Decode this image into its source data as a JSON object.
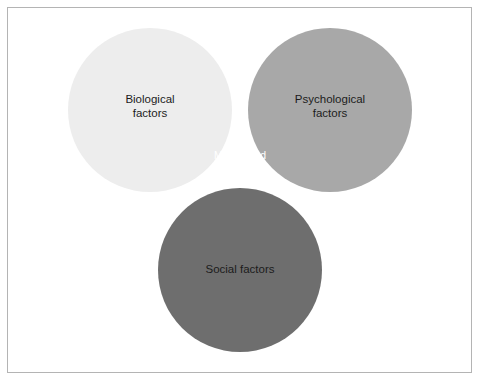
{
  "figure": {
    "type": "venn-diagram-3-set",
    "title": "",
    "background_color": "#ffffff",
    "frame_color": "#b4b4b4"
  },
  "chart_data": {
    "type": "diagram",
    "subtype": "venn",
    "set_count": 3,
    "title": "",
    "sets": [
      {
        "id": "biological",
        "label": "Biological\nfactors",
        "label_line1": "Biological",
        "label_line2": "factors",
        "fill": "#ededed",
        "center_x": 150,
        "center_y": 110,
        "radius": 82,
        "label_color": "#1c1c1c"
      },
      {
        "id": "psychological",
        "label": "Psychological\nfactors",
        "label_line1": "Psychological",
        "label_line2": "factors",
        "fill": "#a8a8a8",
        "center_x": 330,
        "center_y": 110,
        "radius": 82,
        "label_color": "#1c1c1c"
      },
      {
        "id": "social",
        "label": "Social factors",
        "label_line1": "Social factors",
        "label_line2": "",
        "fill": "#6e6e6e",
        "center_x": 240,
        "center_y": 270,
        "radius": 82,
        "label_color": "#1c1c1c"
      }
    ],
    "intersections": [
      {
        "id": "biological-psychological",
        "sets": [
          "biological",
          "psychological"
        ],
        "label": "",
        "fill": "#c4c4c4"
      },
      {
        "id": "biological-social",
        "sets": [
          "biological",
          "social"
        ],
        "label": "",
        "fill": "#a0a0a0"
      },
      {
        "id": "psychological-social",
        "sets": [
          "psychological",
          "social"
        ],
        "label": "",
        "fill": "#8f8f8f"
      },
      {
        "id": "biological-psychological-social",
        "sets": [
          "biological",
          "psychological",
          "social"
        ],
        "label": "Mental and\nbehavioural\ndisorders",
        "label_line1": "Mental and",
        "label_line2": "behavioural",
        "label_line3": "disorders",
        "fill": "#595959",
        "label_color": "#ffffff"
      }
    ]
  }
}
